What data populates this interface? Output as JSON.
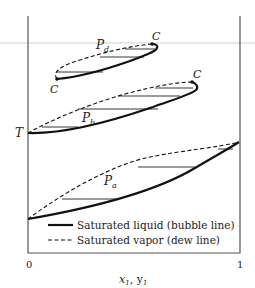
{
  "figure": {
    "type": "Isobaric T-x-y phase diagram with critical points",
    "y_axis_label": "T",
    "x_axis_label": "x1, y1",
    "x_ticks": [
      "0",
      "1"
    ],
    "faint_guide_line": true
  },
  "curves": [
    {
      "name": "P_a",
      "label_main": "P",
      "label_sub": "a",
      "critical_points": []
    },
    {
      "name": "P_b",
      "label_main": "P",
      "label_sub": "b",
      "critical_points": [
        "C"
      ]
    },
    {
      "name": "P_d",
      "label_main": "P",
      "label_sub": "d",
      "critical_points": [
        "C",
        "C"
      ]
    }
  ],
  "critical_label": "C",
  "legend": {
    "items": [
      {
        "style": "solid",
        "label": "Saturated liquid (bubble line)"
      },
      {
        "style": "dashed",
        "label": "Saturated vapor (dew line)"
      }
    ]
  },
  "colors": {
    "line": "#111111",
    "axis": "#555555",
    "guide": "#e3e3e3",
    "background": "#ffffff"
  }
}
